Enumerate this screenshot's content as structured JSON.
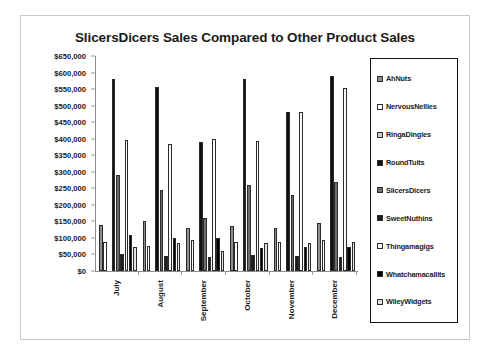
{
  "chart_data": {
    "type": "bar",
    "title": "SlicersDicers Sales Compared to Other Product Sales",
    "xlabel": "",
    "ylabel": "",
    "ylim": [
      0,
      650000
    ],
    "grid": false,
    "legend_position": "right",
    "categories": [
      "July",
      "August",
      "September",
      "October",
      "November",
      "December"
    ],
    "y_ticks": [
      "$0",
      "$50,000",
      "$100,000",
      "$150,000",
      "$200,000",
      "$250,000",
      "$300,000",
      "$350,000",
      "$400,000",
      "$450,000",
      "$500,000",
      "$550,000",
      "$600,000",
      "$650,000"
    ],
    "y_tick_values": [
      0,
      50000,
      100000,
      150000,
      200000,
      250000,
      300000,
      350000,
      400000,
      450000,
      500000,
      550000,
      600000,
      650000
    ],
    "series": [
      {
        "name": "AhNuts",
        "fill": "f-gray-med",
        "values": [
          140000,
          150000,
          130000,
          135000,
          130000,
          145000
        ]
      },
      {
        "name": "NervousNellies",
        "fill": "f-white",
        "values": [
          88000,
          75000,
          95000,
          88000,
          88000,
          95000
        ]
      },
      {
        "name": "RingaDingies",
        "fill": "f-gray-lt",
        "values": [
          0,
          0,
          0,
          0,
          0,
          0
        ]
      },
      {
        "name": "RoundTuits",
        "fill": "f-black",
        "values": [
          580000,
          555000,
          390000,
          580000,
          480000,
          590000
        ]
      },
      {
        "name": "SlicersDicers",
        "fill": "f-gray-dk",
        "values": [
          290000,
          245000,
          160000,
          260000,
          230000,
          270000
        ]
      },
      {
        "name": "SweetNuthins",
        "fill": "f-black2",
        "values": [
          52000,
          45000,
          42000,
          48000,
          45000,
          42000
        ]
      },
      {
        "name": "Thingamagigs",
        "fill": "f-white2",
        "values": [
          395000,
          385000,
          400000,
          392000,
          482000,
          552000
        ]
      },
      {
        "name": "Whatchamacallits",
        "fill": "f-black3",
        "values": [
          110000,
          100000,
          100000,
          70000,
          72000,
          72000
        ]
      },
      {
        "name": "WileyWidgets",
        "fill": "f-gray-xlt",
        "values": [
          72000,
          85000,
          62000,
          85000,
          85000,
          88000
        ]
      }
    ]
  },
  "legend": {
    "items": [
      {
        "label": "AhNuts"
      },
      {
        "label": "NervousNellies"
      },
      {
        "label": "RingaDingies"
      },
      {
        "label": "RoundTuits"
      },
      {
        "label": "SlicersDicers"
      },
      {
        "label": "SweetNuthins"
      },
      {
        "label": "Thingamagigs"
      },
      {
        "label": "Whatchamacallits"
      },
      {
        "label": "WileyWidgets"
      }
    ]
  }
}
